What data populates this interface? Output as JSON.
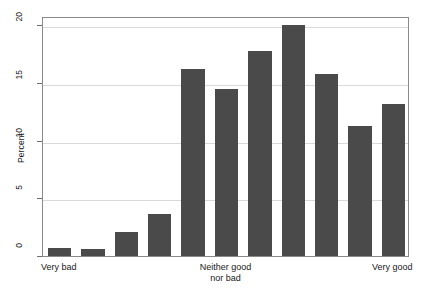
{
  "chart_data": {
    "type": "bar",
    "title": "",
    "subtitle": "",
    "xlabel": "",
    "ylabel": "Percent",
    "ylim": [
      0,
      20.8
    ],
    "yticks": [
      0,
      5,
      10,
      15,
      20
    ],
    "ytick_labels": [
      "0",
      "5",
      "10",
      "15",
      "20"
    ],
    "grid": true,
    "legend": false,
    "legend_position": "none",
    "orientation": "vertical",
    "bar_color": "#4a4a4a",
    "n_bars": 11,
    "categories": [
      "1",
      "2",
      "3",
      "4",
      "5",
      "6",
      "7",
      "8",
      "9",
      "10",
      "11"
    ],
    "values": [
      0.7,
      0.6,
      2.1,
      3.6,
      16.2,
      14.5,
      17.8,
      20.0,
      15.8,
      11.3,
      13.2
    ],
    "x_axis_anchor_labels": [
      {
        "text": "Very bad",
        "at_bar": 1
      },
      {
        "text": "Neither good\nnor bad",
        "at_bar": 6
      },
      {
        "text": "Very good",
        "at_bar": 11
      }
    ]
  },
  "axes": {
    "y_title": "Percent",
    "tick_0": "0",
    "tick_5": "5",
    "tick_10": "10",
    "tick_15": "15",
    "tick_20": "20"
  },
  "labels": {
    "very_bad": "Very bad",
    "neither": "Neither good\nnor bad",
    "very_good": "Very good"
  }
}
